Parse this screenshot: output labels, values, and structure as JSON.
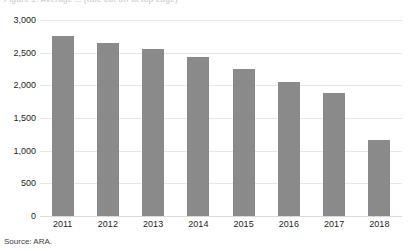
{
  "figure": {
    "title_clipped": "Figure 1. Average ... (title cut off at top edge)",
    "source": "Source: ARA.",
    "bar_color": "#8a8a8a",
    "gridline_color": "#e6e7e8",
    "text_color": "#231f20"
  },
  "chart_data": {
    "type": "bar",
    "title": "",
    "xlabel": "",
    "ylabel": "",
    "categories": [
      "2011",
      "2012",
      "2013",
      "2014",
      "2015",
      "2016",
      "2017",
      "2018"
    ],
    "values": [
      2750,
      2650,
      2560,
      2430,
      2250,
      2050,
      1880,
      1170
    ],
    "ylim": [
      0,
      3000
    ],
    "ytick_values": [
      0,
      500,
      1000,
      1500,
      2000,
      2500,
      3000
    ],
    "ytick_labels": [
      "0",
      "500",
      "1,000",
      "1,500",
      "2,000",
      "2,500",
      "3,000"
    ],
    "grid": "horizontal",
    "legend": "none",
    "series": [
      {
        "name": "value",
        "values": [
          2750,
          2650,
          2560,
          2430,
          2250,
          2050,
          1880,
          1170
        ]
      }
    ]
  }
}
